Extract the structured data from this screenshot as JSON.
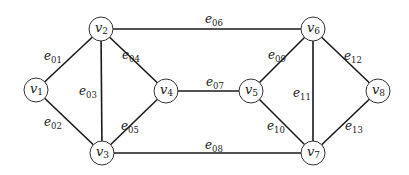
{
  "diagram": {
    "type": "undirected-graph",
    "nodes": [
      {
        "id": "v1",
        "base": "v",
        "sub": "1"
      },
      {
        "id": "v2",
        "base": "v",
        "sub": "2"
      },
      {
        "id": "v3",
        "base": "v",
        "sub": "3"
      },
      {
        "id": "v4",
        "base": "v",
        "sub": "4"
      },
      {
        "id": "v5",
        "base": "v",
        "sub": "5"
      },
      {
        "id": "v6",
        "base": "v",
        "sub": "6"
      },
      {
        "id": "v7",
        "base": "v",
        "sub": "7"
      },
      {
        "id": "v8",
        "base": "v",
        "sub": "8"
      }
    ],
    "edges": [
      {
        "id": "e01",
        "base": "e",
        "sub": "01",
        "from": "v1",
        "to": "v2"
      },
      {
        "id": "e02",
        "base": "e",
        "sub": "02",
        "from": "v1",
        "to": "v3"
      },
      {
        "id": "e03",
        "base": "e",
        "sub": "03",
        "from": "v2",
        "to": "v3"
      },
      {
        "id": "e04",
        "base": "e",
        "sub": "04",
        "from": "v2",
        "to": "v4"
      },
      {
        "id": "e05",
        "base": "e",
        "sub": "05",
        "from": "v3",
        "to": "v4"
      },
      {
        "id": "e06",
        "base": "e",
        "sub": "06",
        "from": "v2",
        "to": "v6"
      },
      {
        "id": "e07",
        "base": "e",
        "sub": "07",
        "from": "v4",
        "to": "v5"
      },
      {
        "id": "e08",
        "base": "e",
        "sub": "08",
        "from": "v3",
        "to": "v7"
      },
      {
        "id": "e09",
        "base": "e",
        "sub": "09",
        "from": "v5",
        "to": "v6"
      },
      {
        "id": "e10",
        "base": "e",
        "sub": "10",
        "from": "v5",
        "to": "v7"
      },
      {
        "id": "e11",
        "base": "e",
        "sub": "11",
        "from": "v6",
        "to": "v7"
      },
      {
        "id": "e12",
        "base": "e",
        "sub": "12",
        "from": "v6",
        "to": "v8"
      },
      {
        "id": "e13",
        "base": "e",
        "sub": "13",
        "from": "v7",
        "to": "v8"
      }
    ]
  }
}
